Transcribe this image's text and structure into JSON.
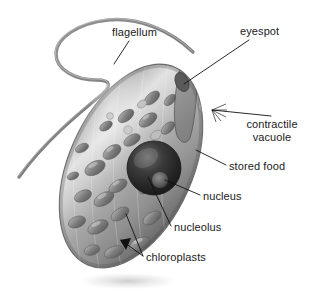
{
  "figure": {
    "style": "grayscale-airbrush-illustration",
    "background_color": "#ffffff",
    "colors": {
      "cell_outline": "#6f6f6f",
      "cell_light": "#d8d8d8",
      "cell_mid": "#9a9a9a",
      "cell_dark": "#5f5f5f",
      "chloroplast": "#7c7c7c",
      "nucleus": "#2b2b2b",
      "nucleolus": "#555555",
      "flagellum": "#8a8a8a",
      "leader_line": "#111111",
      "label_text": "#1a1a1a"
    }
  },
  "labels": [
    {
      "id": "flagellum",
      "text": "flagellum",
      "lines": [
        "flagellum"
      ]
    },
    {
      "id": "eyespot",
      "text": "eyespot",
      "lines": [
        "eyespot"
      ]
    },
    {
      "id": "contractile",
      "text": "contractile vacuole",
      "lines": [
        "contractile",
        "vacuole"
      ]
    },
    {
      "id": "stored_food",
      "text": "stored food",
      "lines": [
        "stored food"
      ]
    },
    {
      "id": "nucleus",
      "text": "nucleus",
      "lines": [
        "nucleus"
      ]
    },
    {
      "id": "nucleolus",
      "text": "nucleolus",
      "lines": [
        "nucleolus"
      ]
    },
    {
      "id": "chloroplasts",
      "text": "chloroplasts",
      "lines": [
        "chloroplasts"
      ]
    }
  ],
  "label_text": {
    "flagellum": "flagellum",
    "eyespot": "eyespot",
    "contractile_line1": "contractile",
    "contractile_line2": "vacuole",
    "stored_food": "stored food",
    "nucleus": "nucleus",
    "nucleolus": "nucleolus",
    "chloroplasts": "chloroplasts"
  },
  "bottom_crop": {
    "text": "",
    "note": "faint cropped caption sliver at image bottom edge"
  }
}
